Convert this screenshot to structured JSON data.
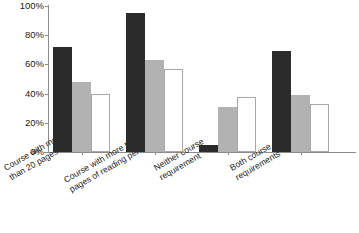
{
  "chart_data": {
    "type": "bar",
    "title": "",
    "xlabel": "",
    "ylabel": "",
    "ylim": [
      0,
      100
    ],
    "grid": false,
    "legend_position": "none",
    "y_ticks": [
      "0%",
      "20%",
      "40%",
      "60%",
      "80%",
      "100%"
    ],
    "y_tick_values": [
      0,
      20,
      40,
      60,
      80,
      100
    ],
    "categories": [
      "Course with more\nthan 20 pages of writing",
      "Course with more than 40\npages of reading per week",
      "Neither course\nrequirement",
      "Both course\nrequirements"
    ],
    "series": [
      {
        "name": "series-1",
        "color": "#2b2b2b",
        "values": [
          72,
          95,
          5,
          69
        ]
      },
      {
        "name": "series-2",
        "color": "#b2b2b2",
        "values": [
          48,
          63,
          31,
          39
        ]
      },
      {
        "name": "series-3",
        "color": "#ffffff",
        "values": [
          40,
          57,
          38,
          33
        ]
      }
    ]
  },
  "axis": {
    "axis_color": "#8c8c8c",
    "background": "#ffffff"
  }
}
